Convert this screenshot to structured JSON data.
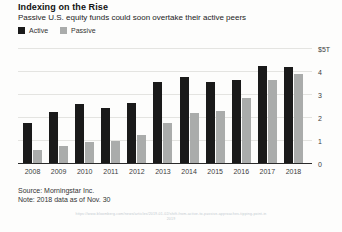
{
  "chart_data": {
    "type": "bar",
    "title": "Indexing on the Rise",
    "subtitle": "Passive U.S. equity funds could soon overtake their active peers",
    "categories": [
      "2008",
      "2009",
      "2010",
      "2011",
      "2012",
      "2013",
      "2014",
      "2015",
      "2016",
      "2017",
      "2018"
    ],
    "series": [
      {
        "name": "Active",
        "color": "#1a1a1a",
        "values": [
          1.8,
          2.25,
          2.6,
          2.45,
          2.65,
          3.55,
          3.8,
          3.55,
          3.65,
          4.25,
          4.2
        ]
      },
      {
        "name": "Passive",
        "color": "#aaacab",
        "values": [
          0.6,
          0.8,
          0.95,
          1.0,
          1.25,
          1.8,
          2.2,
          2.3,
          2.85,
          3.65,
          3.9
        ]
      }
    ],
    "unit": "USD trillions",
    "ylim": [
      0,
      5
    ],
    "y_ticks": [
      {
        "value": 5,
        "label": "$5T"
      },
      {
        "value": 4,
        "label": "4"
      },
      {
        "value": 3,
        "label": "3"
      },
      {
        "value": 2,
        "label": "2"
      },
      {
        "value": 1,
        "label": "1"
      },
      {
        "value": 0,
        "label": "0"
      }
    ],
    "grid": "horizontal",
    "legend_position": "top-left"
  },
  "legend": [
    {
      "label": "Active",
      "color": "#1a1a1a"
    },
    {
      "label": "Passive",
      "color": "#aaacab"
    }
  ],
  "footer": {
    "source": "Source: Morningstar Inc.",
    "note": "Note: 2018 data as of Nov. 30",
    "caption_line1": "https://www.bloomberg.com/news/articles/2019-01-02/shift-from-active-to-passive-approaches-tipping-point-in",
    "caption_line2": "2019"
  }
}
